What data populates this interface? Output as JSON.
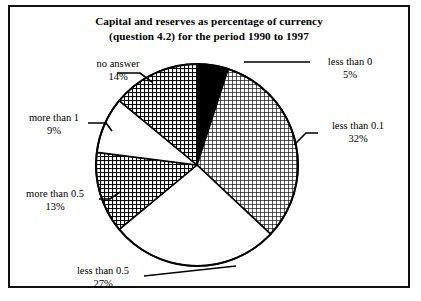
{
  "figure": {
    "title_line1": "Capital and reserves as percentage of currency",
    "title_line2": "(question 4.2) for the period 1990 to 1997",
    "border_color": "#111111",
    "background": "#ffffff"
  },
  "chart_data": {
    "type": "pie",
    "title": "Capital and reserves as percentage of currency (question 4.2) for the period 1990 to 1997",
    "xlabel": "",
    "ylabel": "",
    "grid": false,
    "legend_position": "none",
    "labels_outside": true,
    "total_percent": 100,
    "start_angle_deg": 0,
    "direction": "clockwise",
    "categories": [
      "less than 0",
      "less than 0.1",
      "less than 0.5",
      "more than 0.5",
      "more than 1",
      "no answer"
    ],
    "values": [
      5,
      32,
      27,
      13,
      9,
      14
    ],
    "slices": [
      {
        "label": "less than 0",
        "percent_text": "5%",
        "value": 5,
        "fill": "solid-black",
        "color": "#000000"
      },
      {
        "label": "less than 0.1",
        "percent_text": "32%",
        "value": 32,
        "fill": "fine-grid",
        "color": "#000000"
      },
      {
        "label": "less than 0.5",
        "percent_text": "27%",
        "value": 27,
        "fill": "white",
        "color": "#ffffff"
      },
      {
        "label": "more than 0.5",
        "percent_text": "13%",
        "value": 13,
        "fill": "dense-crosshatch",
        "color": "#000000"
      },
      {
        "label": "more than 1",
        "percent_text": "9%",
        "value": 9,
        "fill": "white",
        "color": "#ffffff"
      },
      {
        "label": "no answer",
        "percent_text": "14%",
        "value": 14,
        "fill": "dense-crosshatch",
        "color": "#000000"
      }
    ]
  },
  "labels": {
    "no_answer": {
      "name": "no answer",
      "pct": "14%"
    },
    "less_than_0": {
      "name": "less than 0",
      "pct": "5%"
    },
    "less_than_01": {
      "name": "less than 0.1",
      "pct": "32%"
    },
    "more_than_1": {
      "name": "more than 1",
      "pct": "9%"
    },
    "more_than_05": {
      "name": "more than 0.5",
      "pct": "13%"
    },
    "less_than_05": {
      "name": "less than 0.5",
      "pct": "27%"
    }
  }
}
